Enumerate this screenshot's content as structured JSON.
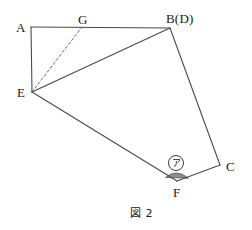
{
  "figure": {
    "caption": "図 2",
    "background_color": "#ffffff",
    "stroke_color": "#4a4a4a",
    "shade_color": "#8c8c8c",
    "width": 252,
    "height": 230,
    "vertices": [
      {
        "id": "A",
        "label": "A",
        "x": 31,
        "y": 27,
        "label_x": 16,
        "label_y": 21
      },
      {
        "id": "G",
        "label": "G",
        "x": 82,
        "y": 27,
        "label_x": 78,
        "label_y": 13
      },
      {
        "id": "B",
        "label": "B(D)",
        "x": 170,
        "y": 28,
        "label_x": 166,
        "label_y": 12
      },
      {
        "id": "C",
        "label": "C",
        "x": 220,
        "y": 165,
        "label_x": 226,
        "label_y": 160
      },
      {
        "id": "F",
        "label": "F",
        "x": 177,
        "y": 181,
        "label_x": 173,
        "label_y": 186
      },
      {
        "id": "E",
        "label": "E",
        "x": 32,
        "y": 92,
        "label_x": 17,
        "label_y": 86
      }
    ],
    "solid_edges": [
      {
        "name": "edge-A-B",
        "from": "A",
        "to": "B"
      },
      {
        "name": "edge-A-E",
        "from": "A",
        "to": "E"
      },
      {
        "name": "edge-E-B",
        "from": "E",
        "to": "B"
      },
      {
        "name": "edge-B-C",
        "from": "B",
        "to": "C"
      },
      {
        "name": "edge-C-F",
        "from": "C",
        "to": "F"
      },
      {
        "name": "edge-F-E",
        "from": "F",
        "to": "E"
      }
    ],
    "dashed_edges": [
      {
        "name": "edge-E-G",
        "from": "E",
        "to": "G"
      }
    ],
    "angle_marker": {
      "label": "ア",
      "at_vertex": "F",
      "label_x": 168,
      "label_y": 155,
      "fill": "#8c8c8c",
      "stroke": "#4a4a4a"
    },
    "caption_x": 130,
    "caption_y": 208
  }
}
